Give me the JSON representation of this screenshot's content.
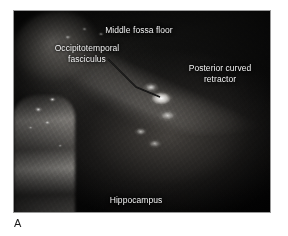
{
  "figure": {
    "panel_letter": "A",
    "photo": {
      "kind": "intraoperative-surgical-photograph",
      "frame_border_color": "#9a9a9a",
      "background_color": "#050505",
      "label_text_color": "#f2f2f2"
    },
    "labels": [
      {
        "id": "middle-fossa-floor",
        "text": "Middle fossa floor"
      },
      {
        "id": "occipitotemporal-fasciculus",
        "text": "Occipitotemporal\nfasciculus"
      },
      {
        "id": "posterior-curved-retractor",
        "text": "Posterior curved\nretractor"
      },
      {
        "id": "hippocampus",
        "text": "Hippocampus"
      }
    ]
  }
}
